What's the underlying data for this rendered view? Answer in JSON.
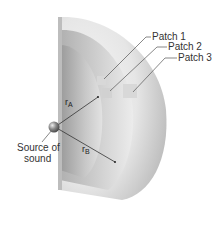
{
  "diagram": {
    "labels": {
      "patch_1": "Patch 1",
      "patch_2": "Patch 2",
      "patch_3": "Patch 3",
      "source_line1": "Source of",
      "source_line2": "sound",
      "radius_a_main": "r",
      "radius_a_sub": "A",
      "radius_b_main": "r",
      "radius_b_sub": "B"
    },
    "colors": {
      "shell_light": "#f2f2f2",
      "shell_mid": "#d4d4d4",
      "shell_dark": "#a8a8a8",
      "leader_line": "#555555",
      "text": "#333333"
    }
  }
}
